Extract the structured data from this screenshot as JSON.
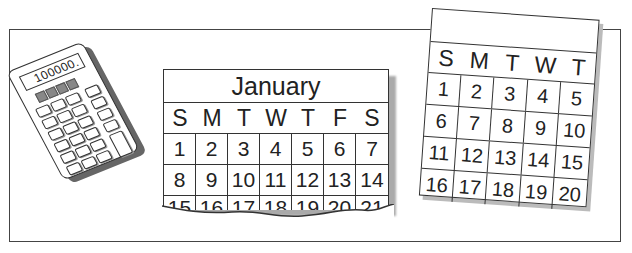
{
  "calculator": {
    "display": "100000.",
    "solar_cells": 4,
    "key_rows": 6,
    "key_cols": 3
  },
  "january_calendar": {
    "title": "January",
    "weekdays": [
      "S",
      "M",
      "T",
      "W",
      "T",
      "F",
      "S"
    ],
    "rows": [
      [
        "1",
        "2",
        "3",
        "4",
        "5",
        "6",
        "7"
      ],
      [
        "8",
        "9",
        "10",
        "11",
        "12",
        "13",
        "14"
      ]
    ],
    "torn_row": [
      "15",
      "16",
      "17",
      "18",
      "19",
      "20",
      "21"
    ]
  },
  "tilted_calendar": {
    "weekdays": [
      "S",
      "M",
      "T",
      "W",
      "T"
    ],
    "rows": [
      [
        "1",
        "2",
        "3",
        "4",
        "5"
      ],
      [
        "6",
        "7",
        "8",
        "9",
        "10"
      ],
      [
        "11",
        "12",
        "13",
        "14",
        "15"
      ],
      [
        "16",
        "17",
        "18",
        "19",
        "20"
      ]
    ]
  }
}
